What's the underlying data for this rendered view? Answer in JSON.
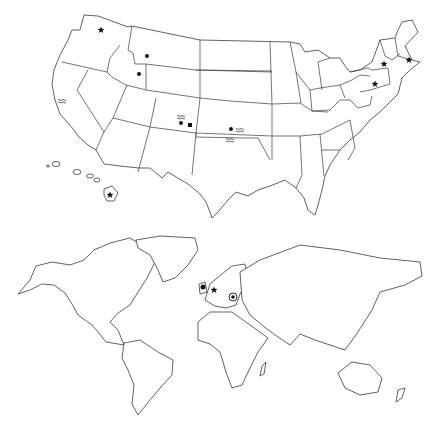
{
  "maps": {
    "usa": {
      "name": "United States map",
      "markers": [
        {
          "id": "washington-star",
          "type": "star",
          "x": 101,
          "y": 30
        },
        {
          "id": "montana-dot",
          "type": "dot",
          "x": 147,
          "y": 56
        },
        {
          "id": "idaho-dot",
          "type": "dot",
          "x": 139,
          "y": 74
        },
        {
          "id": "california-waves",
          "type": "waves",
          "x": 62,
          "y": 100
        },
        {
          "id": "colorado-waves",
          "type": "waves",
          "x": 181,
          "y": 116
        },
        {
          "id": "colorado-dot",
          "type": "dot",
          "x": 181,
          "y": 123
        },
        {
          "id": "colorado-square",
          "type": "square",
          "x": 190,
          "y": 125
        },
        {
          "id": "kansas-dot",
          "type": "dot",
          "x": 231,
          "y": 129
        },
        {
          "id": "kansas-waves",
          "type": "waves",
          "x": 240,
          "y": 129
        },
        {
          "id": "oklahoma-waves",
          "type": "waves",
          "x": 230,
          "y": 139
        },
        {
          "id": "new-york-star",
          "type": "star",
          "x": 384,
          "y": 64
        },
        {
          "id": "pennsylvania-star",
          "type": "star",
          "x": 375,
          "y": 84
        },
        {
          "id": "massachusetts-star",
          "type": "star",
          "x": 409,
          "y": 60
        },
        {
          "id": "hawaii-star",
          "type": "star",
          "x": 110,
          "y": 195
        }
      ]
    },
    "world": {
      "name": "World map",
      "markers": [
        {
          "id": "uk-circle",
          "type": "circle-outline",
          "x": 203,
          "y": 287
        },
        {
          "id": "germany-star",
          "type": "star",
          "x": 214,
          "y": 290
        },
        {
          "id": "eastern-europe-target",
          "type": "target",
          "x": 233,
          "y": 297
        }
      ]
    }
  }
}
